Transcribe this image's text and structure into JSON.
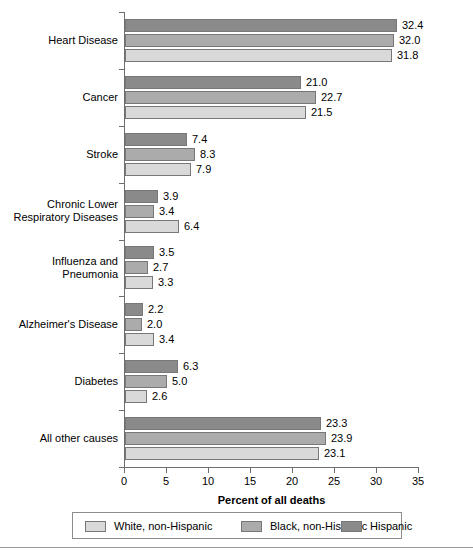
{
  "chart_data": {
    "type": "bar",
    "orientation": "horizontal",
    "title": "",
    "xlabel": "Percent of all deaths",
    "ylabel": "",
    "xlim": [
      0,
      35
    ],
    "xticks": [
      0,
      5,
      10,
      15,
      20,
      25,
      30,
      35
    ],
    "xtick_labels": [
      "0",
      "5",
      "10",
      "15",
      "20",
      "25",
      "30",
      "35"
    ],
    "grid": false,
    "legend_position": "bottom",
    "categories": [
      "Heart Disease",
      "Cancer",
      "Stroke",
      "Chronic Lower Respiratory Diseases",
      "Influenza and Pneumonia",
      "Alzheimer's Disease",
      "Diabetes",
      "All other causes"
    ],
    "category_label_lines": [
      [
        "Heart Disease"
      ],
      [
        "Cancer"
      ],
      [
        "Stroke"
      ],
      [
        "Chronic Lower",
        "Respiratory Diseases"
      ],
      [
        "Influenza and",
        "Pneumonia"
      ],
      [
        "Alzheimer's Disease"
      ],
      [
        "Diabetes"
      ],
      [
        "All other causes"
      ]
    ],
    "series": [
      {
        "name": "White, non-Hispanic",
        "color": "#d9d9d9",
        "values": [
          31.8,
          21.5,
          7.9,
          6.4,
          3.3,
          3.4,
          2.6,
          23.1
        ],
        "value_labels": [
          "31.8",
          "21.5",
          "7.9",
          "6.4",
          "3.3",
          "3.4",
          "2.6",
          "23.1"
        ]
      },
      {
        "name": "Black, non-Hispanic",
        "color": "#ababab",
        "values": [
          32.0,
          22.7,
          8.3,
          3.4,
          2.7,
          2.0,
          5.0,
          23.9
        ],
        "value_labels": [
          "32.0",
          "22.7",
          "8.3",
          "3.4",
          "2.7",
          "2.0",
          "5.0",
          "23.9"
        ]
      },
      {
        "name": "Hispanic",
        "color": "#8a8a8a",
        "values": [
          32.4,
          21.0,
          7.4,
          3.9,
          3.5,
          2.2,
          6.3,
          23.3
        ],
        "value_labels": [
          "32.4",
          "21.0",
          "7.4",
          "3.9",
          "3.5",
          "2.2",
          "6.3",
          "23.3"
        ]
      }
    ]
  },
  "legend": {
    "entries": [
      {
        "label": "White, non-Hispanic"
      },
      {
        "label": "Black, non-Hispanic"
      },
      {
        "label": "Hispanic"
      }
    ]
  }
}
